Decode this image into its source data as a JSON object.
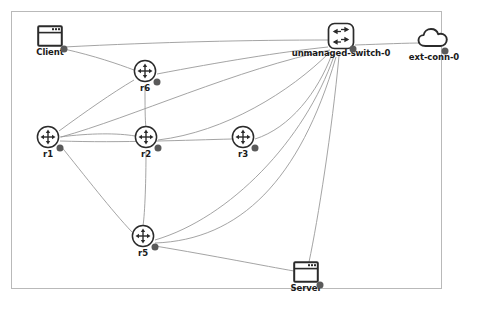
{
  "diagram": {
    "background_color": "#ffffff",
    "frame_color": "#b9b9b9",
    "edge_color": "#9a9a9a",
    "node_stroke_color": "#2b2b2b",
    "port_color": "#5a5a5a",
    "label_color": "#1a1a1a"
  },
  "nodes": [
    {
      "id": "client",
      "label": "Client",
      "type": "host",
      "icon": "window-icon",
      "x": 50,
      "y": 38,
      "label_x": 50,
      "label_y": 52,
      "port_x": 64,
      "port_y": 49
    },
    {
      "id": "unmanaged-switch-0",
      "label": "unmanaged-switch-0",
      "type": "switch",
      "icon": "switch-icon",
      "x": 341,
      "y": 38,
      "label_x": 341,
      "label_y": 52,
      "port_x": 353,
      "port_y": 49
    },
    {
      "id": "ext-conn-0",
      "label": "ext-conn-0",
      "type": "external-connection",
      "icon": "cloud-icon",
      "x": 434,
      "y": 40,
      "label_x": 434,
      "label_y": 56,
      "port_x": 445,
      "port_y": 51
    },
    {
      "id": "r6",
      "label": "r6",
      "type": "router",
      "icon": "router-icon",
      "x": 145,
      "y": 73,
      "label_x": 145,
      "label_y": 87,
      "port_x": 157,
      "port_y": 82
    },
    {
      "id": "r1",
      "label": "r1",
      "type": "router",
      "icon": "router-icon",
      "x": 48,
      "y": 139,
      "label_x": 48,
      "label_y": 153,
      "port_x": 60,
      "port_y": 148
    },
    {
      "id": "r2",
      "label": "r2",
      "type": "router",
      "icon": "router-icon",
      "x": 146,
      "y": 139,
      "label_x": 146,
      "label_y": 153,
      "port_x": 158,
      "port_y": 148
    },
    {
      "id": "r3",
      "label": "r3",
      "type": "router",
      "icon": "router-icon",
      "x": 243,
      "y": 139,
      "label_x": 243,
      "label_y": 153,
      "port_x": 255,
      "port_y": 148
    },
    {
      "id": "r5",
      "label": "r5",
      "type": "router",
      "icon": "router-icon",
      "x": 143,
      "y": 238,
      "label_x": 143,
      "label_y": 252,
      "port_x": 155,
      "port_y": 247
    },
    {
      "id": "server",
      "label": "Server",
      "type": "host",
      "icon": "window-icon",
      "x": 306,
      "y": 274,
      "label_x": 306,
      "label_y": 288,
      "port_x": 320,
      "port_y": 285
    }
  ],
  "edges": [
    {
      "id": "client-switch",
      "from": "client",
      "to": "unmanaged-switch-0",
      "path": "M 64,47 C 160,42 250,40 330,40"
    },
    {
      "id": "switch-extconn",
      "from": "unmanaged-switch-0",
      "to": "ext-conn-0",
      "path": "M 355,45 C 385,44 405,43 424,43"
    },
    {
      "id": "client-r6",
      "from": "client",
      "to": "r6",
      "path": "M 64,49 C 95,56 118,64 134,70"
    },
    {
      "id": "r6-switch",
      "from": "r6",
      "to": "unmanaged-switch-0",
      "path": "M 157,74 C 220,62 280,52 328,47"
    },
    {
      "id": "r6-r2",
      "from": "r6",
      "to": "r2",
      "path": "M 145,85 C 145,105 145,120 146,128"
    },
    {
      "id": "r1-r6",
      "from": "r1",
      "to": "r6",
      "path": "M 59,131 C 85,112 112,93 134,80"
    },
    {
      "id": "r1-r2",
      "from": "r1",
      "to": "r2",
      "path": "M 60,137 C 90,133 118,133 135,136"
    },
    {
      "id": "r1-r5",
      "from": "r1",
      "to": "r5",
      "path": "M 60,145 C 85,176 112,211 132,232"
    },
    {
      "id": "r2-r5",
      "from": "r2",
      "to": "r5",
      "path": "M 146,151 C 146,180 145,212 143,226"
    },
    {
      "id": "r2-switch",
      "from": "r2",
      "to": "unmanaged-switch-0",
      "path": "M 158,140 C 225,132 290,92 330,52"
    },
    {
      "id": "r3-switch",
      "from": "r3",
      "to": "unmanaged-switch-0",
      "path": "M 255,139 C 290,128 318,92 332,54"
    },
    {
      "id": "r1-r3",
      "from": "r1",
      "to": "r3",
      "path": "M 60,141 C 120,143 190,140 232,139"
    },
    {
      "id": "r5-switch",
      "from": "r5",
      "to": "unmanaged-switch-0",
      "path": "M 155,240 C 230,218 305,140 334,56"
    },
    {
      "id": "r5-switch-2",
      "from": "r5",
      "to": "unmanaged-switch-0",
      "path": "M 155,243 C 240,240 300,180 336,57"
    },
    {
      "id": "r5-server",
      "from": "r5",
      "to": "server",
      "path": "M 155,246 C 215,256 265,266 294,271"
    },
    {
      "id": "switch-server",
      "from": "unmanaged-switch-0",
      "to": "server",
      "path": "M 339,56 C 332,130 318,220 309,262"
    },
    {
      "id": "switch-r1-long",
      "from": "unmanaged-switch-0",
      "to": "r1",
      "path": "M 330,50 C 240,68 130,118 61,137"
    }
  ],
  "icons": {
    "window": "window-icon",
    "switch": "switch-icon",
    "router": "router-icon",
    "cloud": "cloud-icon"
  }
}
